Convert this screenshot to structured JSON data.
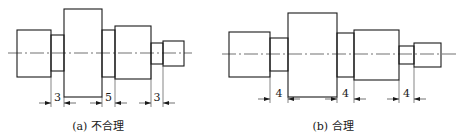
{
  "figures": [
    {
      "id": "a",
      "caption": "(a) 不合理",
      "verdict": "unreasonable",
      "groove_widths": [
        "3",
        "5",
        "3"
      ]
    },
    {
      "id": "b",
      "caption": "(b) 合理",
      "verdict": "reasonable",
      "groove_widths": [
        "4",
        "4",
        "4"
      ]
    }
  ]
}
